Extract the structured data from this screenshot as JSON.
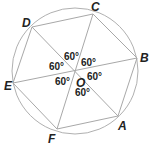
{
  "diagram": {
    "circle": {
      "cx": 75,
      "cy": 71,
      "r": 63
    },
    "center": {
      "label": "O",
      "x": 75,
      "y": 71,
      "label_x": 76,
      "label_y": 87
    },
    "vertices": [
      {
        "label": "A",
        "x": 118,
        "y": 116,
        "label_x": 118,
        "label_y": 130
      },
      {
        "label": "B",
        "x": 137,
        "y": 58,
        "label_x": 140,
        "label_y": 62
      },
      {
        "label": "C",
        "x": 93,
        "y": 14,
        "label_x": 91,
        "label_y": 11
      },
      {
        "label": "D",
        "x": 32,
        "y": 27,
        "label_x": 22,
        "label_y": 27
      },
      {
        "label": "E",
        "x": 13,
        "y": 83,
        "label_x": 4,
        "label_y": 90
      },
      {
        "label": "F",
        "x": 57,
        "y": 129,
        "label_x": 48,
        "label_y": 143
      }
    ],
    "angle_labels": [
      {
        "text": "60°",
        "x": 64,
        "y": 60
      },
      {
        "text": "60°",
        "x": 81,
        "y": 66
      },
      {
        "text": "60°",
        "x": 49,
        "y": 70
      },
      {
        "text": "60°",
        "x": 87,
        "y": 80
      },
      {
        "text": "60°",
        "x": 55,
        "y": 85
      },
      {
        "text": "60°",
        "x": 75,
        "y": 96
      }
    ]
  }
}
